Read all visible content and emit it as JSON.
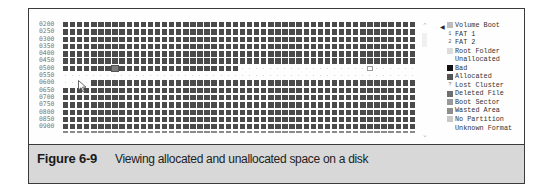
{
  "window": {
    "row_labels": [
      "0200",
      "0250",
      "0300",
      "0350",
      "0400",
      "0450",
      "0500",
      "0550",
      "0600",
      "0650",
      "0700",
      "0750",
      "0800",
      "0850",
      "0900"
    ],
    "columns": 50,
    "rows": [
      {
        "label": "0200",
        "allocated_from": 0,
        "allocated_to": 50
      },
      {
        "label": "0250",
        "allocated_from": 0,
        "allocated_to": 50
      },
      {
        "label": "0300",
        "allocated_from": 0,
        "allocated_to": 50
      },
      {
        "label": "0350",
        "allocated_from": 0,
        "allocated_to": 50
      },
      {
        "label": "0400",
        "allocated_from": 0,
        "allocated_to": 50
      },
      {
        "label": "0450",
        "allocated_from": 0,
        "allocated_to": 50
      },
      {
        "label": "0500",
        "allocated_from": 0,
        "allocated_to": 25,
        "selected_col": 7,
        "marker_col": 43
      },
      {
        "label": "0550",
        "allocated_from": 50,
        "allocated_to": 50
      },
      {
        "label": "0600",
        "allocated_from": 4,
        "allocated_to": 50
      },
      {
        "label": "0650",
        "allocated_from": 0,
        "allocated_to": 50
      },
      {
        "label": "0700",
        "allocated_from": 0,
        "allocated_to": 50
      },
      {
        "label": "0750",
        "allocated_from": 0,
        "allocated_to": 50
      },
      {
        "label": "0800",
        "allocated_from": 0,
        "allocated_to": 50
      },
      {
        "label": "0850",
        "allocated_from": 0,
        "allocated_to": 50
      },
      {
        "label": "0900",
        "allocated_from": 0,
        "allocated_to": 50
      }
    ],
    "legend": [
      {
        "label": "Volume Boot",
        "swatch": "#bdbdbd",
        "glyph": ""
      },
      {
        "label": "FAT 1",
        "swatch": "#ffffff",
        "glyph": "1"
      },
      {
        "label": "FAT 2",
        "swatch": "#ffffff",
        "glyph": "2"
      },
      {
        "label": "Root Folder",
        "swatch": "#dcdcdc",
        "glyph": ""
      },
      {
        "label": "Unallocated",
        "swatch": "#ffffff",
        "glyph": ""
      },
      {
        "label": "Bad",
        "swatch": "#111111",
        "glyph": ""
      },
      {
        "label": "Allocated",
        "swatch": "#555555",
        "glyph": ""
      },
      {
        "label": "Lost Cluster",
        "swatch": "#ffffff",
        "glyph": "?"
      },
      {
        "label": "Deleted File",
        "swatch": "#6e6e6e",
        "glyph": ""
      },
      {
        "label": "Boot Sector",
        "swatch": "#9a9a9a",
        "glyph": ""
      },
      {
        "label": "Wasted Area",
        "swatch": "#8e8e8e",
        "glyph": ""
      },
      {
        "label": "No Partition",
        "swatch": "#c8c8c8",
        "glyph": ""
      },
      {
        "label": "Unknown Format",
        "swatch": "#ffffff",
        "glyph": ""
      }
    ],
    "scrollbar": {
      "up_glyph": "⌃",
      "down_glyph": "⌄"
    },
    "pointer_glyph": "◀"
  },
  "caption": {
    "figure_label": "Figure 6-9",
    "text": "Viewing allocated and unallocated space on a disk"
  },
  "colors": {
    "allocated": "#4a4a4a",
    "caption_bg": "#d8d8d8",
    "frame": "#3a3a3a"
  }
}
